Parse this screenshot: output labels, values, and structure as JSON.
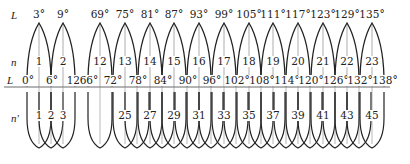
{
  "row_labels": {
    "top_L": "L",
    "n": "n",
    "axis_L": "L",
    "n_prime": "n′"
  },
  "colors": {
    "stroke": "#222222",
    "axis": "#444444",
    "background": "#ffffff"
  },
  "top_zones": [
    {
      "n": "1",
      "L_center": "3°",
      "x": 39
    },
    {
      "n": "2",
      "L_center": "9°",
      "x": 63
    },
    {
      "n": "12",
      "L_center": "69°",
      "x": 100
    },
    {
      "n": "13",
      "L_center": "75°",
      "x": 125
    },
    {
      "n": "14",
      "L_center": "81°",
      "x": 150
    },
    {
      "n": "15",
      "L_center": "87°",
      "x": 174
    },
    {
      "n": "16",
      "L_center": "93°",
      "x": 199
    },
    {
      "n": "17",
      "L_center": "99°",
      "x": 224
    },
    {
      "n": "18",
      "L_center": "105°",
      "x": 249
    },
    {
      "n": "19",
      "L_center": "111°",
      "x": 273
    },
    {
      "n": "20",
      "L_center": "117°",
      "x": 298
    },
    {
      "n": "21",
      "L_center": "123°",
      "x": 323
    },
    {
      "n": "22",
      "L_center": "129°",
      "x": 347
    },
    {
      "n": "23",
      "L_center": "135°",
      "x": 372
    }
  ],
  "axis_ticks": [
    {
      "label": "0°",
      "x": 27
    },
    {
      "label": "6°",
      "x": 51
    },
    {
      "label": "12°",
      "x": 75
    },
    {
      "label": "66°",
      "x": 88
    },
    {
      "label": "72°",
      "x": 112
    },
    {
      "label": "78°",
      "x": 137
    },
    {
      "label": "84°",
      "x": 162
    },
    {
      "label": "90°",
      "x": 187
    },
    {
      "label": "96°",
      "x": 211
    },
    {
      "label": "102°",
      "x": 236
    },
    {
      "label": "108°",
      "x": 261
    },
    {
      "label": "114°",
      "x": 286
    },
    {
      "label": "120°",
      "x": 310
    },
    {
      "label": "126°",
      "x": 335
    },
    {
      "label": "132°",
      "x": 359
    },
    {
      "label": "138°",
      "x": 384
    }
  ],
  "bottom_zones": [
    {
      "n_prime": "1",
      "x": 39,
      "labeled": true
    },
    {
      "n_prime": "2",
      "x": 51,
      "labeled": true
    },
    {
      "n_prime": "3",
      "x": 63,
      "labeled": true
    },
    {
      "n_prime": "24",
      "x": 100,
      "labeled": false
    },
    {
      "n_prime": "25",
      "x": 125,
      "labeled": true
    },
    {
      "n_prime": "26",
      "x": 137,
      "labeled": false
    },
    {
      "n_prime": "27",
      "x": 150,
      "labeled": true
    },
    {
      "n_prime": "28",
      "x": 162,
      "labeled": false
    },
    {
      "n_prime": "29",
      "x": 174,
      "labeled": true
    },
    {
      "n_prime": "30",
      "x": 187,
      "labeled": false
    },
    {
      "n_prime": "31",
      "x": 199,
      "labeled": true
    },
    {
      "n_prime": "32",
      "x": 211,
      "labeled": false
    },
    {
      "n_prime": "33",
      "x": 224,
      "labeled": true
    },
    {
      "n_prime": "34",
      "x": 236,
      "labeled": false
    },
    {
      "n_prime": "35",
      "x": 249,
      "labeled": true
    },
    {
      "n_prime": "36",
      "x": 261,
      "labeled": false
    },
    {
      "n_prime": "37",
      "x": 273,
      "labeled": true
    },
    {
      "n_prime": "38",
      "x": 286,
      "labeled": false
    },
    {
      "n_prime": "39",
      "x": 298,
      "labeled": true
    },
    {
      "n_prime": "40",
      "x": 310,
      "labeled": false
    },
    {
      "n_prime": "41",
      "x": 323,
      "labeled": true
    },
    {
      "n_prime": "42",
      "x": 335,
      "labeled": false
    },
    {
      "n_prime": "43",
      "x": 347,
      "labeled": true
    },
    {
      "n_prime": "44",
      "x": 359,
      "labeled": false
    },
    {
      "n_prime": "45",
      "x": 372,
      "labeled": true
    }
  ]
}
